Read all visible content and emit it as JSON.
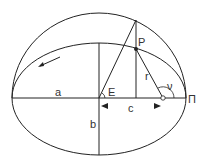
{
  "diagram": {
    "labels": {
      "a": "a",
      "b": "b",
      "c": "c",
      "E": "E",
      "P": "P",
      "r": "r",
      "nu": "ν",
      "pi": "Π"
    },
    "colors": {
      "stroke": "#222222",
      "label": "#333333",
      "background": "#ffffff"
    }
  }
}
